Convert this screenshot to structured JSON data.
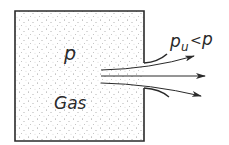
{
  "diagram": {
    "container_label": "Gas",
    "inner_pressure_label": "p",
    "outer_pressure_label": "p",
    "outer_pressure_subscript": "u",
    "comparison_symbol": "<",
    "colors": {
      "line": "#2a2a2a",
      "dots": "#8a8a8a",
      "background": "#ffffff"
    }
  }
}
